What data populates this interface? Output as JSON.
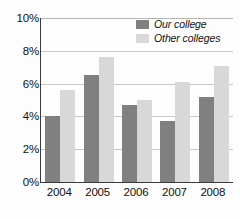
{
  "chart_data": {
    "type": "bar",
    "title": "",
    "subtitle": "",
    "xlabel": "",
    "ylabel": "",
    "categories": [
      "2004",
      "2005",
      "2006",
      "2007",
      "2008"
    ],
    "series": [
      {
        "name": "Our college",
        "values": [
          4.0,
          6.5,
          4.7,
          3.7,
          5.2
        ],
        "color": "#808080"
      },
      {
        "name": "Other colleges",
        "values": [
          5.6,
          7.6,
          5.0,
          6.1,
          7.1
        ],
        "color": "#d8d8d8"
      }
    ],
    "ylim": [
      0,
      10
    ],
    "ytick_values": [
      0,
      2,
      4,
      6,
      8,
      10
    ],
    "ytick_labels": [
      "0%",
      "2%",
      "4%",
      "6%",
      "8%",
      "10%"
    ],
    "grid": true,
    "grid_axis": "y",
    "legend_position": "top-right",
    "value_unit": "%"
  },
  "legend": {
    "entries": [
      {
        "label": "Our college"
      },
      {
        "label": "Other colleges"
      }
    ]
  },
  "colors": {
    "series_our_college": "#808080",
    "series_other_colleges": "#d8d8d8",
    "axis": "#3a3a3a",
    "gridline": "#c9c9c9",
    "text": "#111111",
    "background": "#fdfdfd"
  }
}
